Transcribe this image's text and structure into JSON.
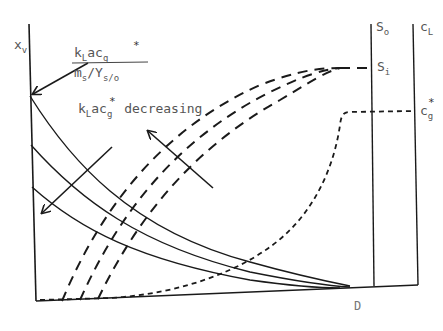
{
  "diagram": {
    "y_axis_label": {
      "main": "x",
      "sub": "v"
    },
    "top_annotation": {
      "numerator": {
        "k": "k",
        "k_sub": "L",
        "ac": "ac",
        "g": "g",
        "star": "*"
      },
      "denominator": {
        "m": "m",
        "m_sub": "s",
        "slash": "/Y",
        "y_sub": "s/o"
      }
    },
    "decreasing_label": {
      "k": "k",
      "k_sub": "L",
      "ac": "ac",
      "g": "g",
      "star": "*",
      "text": "decreasing"
    },
    "right_labels": {
      "s_o": {
        "main": "S",
        "sub": "o"
      },
      "c_l": {
        "main": "c",
        "sub": "L"
      },
      "s_i": {
        "main": "S",
        "sub": "i"
      },
      "c_g_star": {
        "main": "c",
        "sub": "g",
        "star": "*"
      }
    },
    "x_axis_label": "D",
    "line_color": "#1a1a1a",
    "series": [
      {
        "name": "x_v (solid, top)",
        "style": "solid"
      },
      {
        "name": "x_v (solid, middle)",
        "style": "solid"
      },
      {
        "name": "x_v (solid, bottom)",
        "style": "solid"
      },
      {
        "name": "S (long-dash, 3 curves)",
        "style": "long-dash"
      },
      {
        "name": "c_L (short-dash)",
        "style": "short-dash"
      }
    ]
  }
}
